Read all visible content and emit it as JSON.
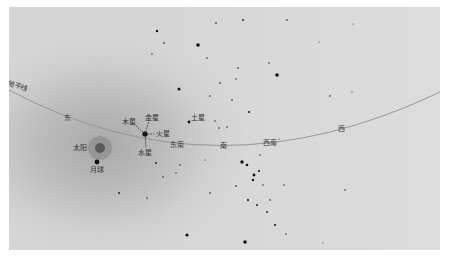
{
  "diagram": {
    "type": "sky-chart",
    "background_color": "#d6d6d6",
    "horizon": {
      "label": "地平线",
      "color": "#8c8c8c"
    },
    "directions": [
      {
        "label": "东",
        "x": 64,
        "y": 115
      },
      {
        "label": "东南",
        "x": 170,
        "y": 142
      },
      {
        "label": "南",
        "x": 220,
        "y": 142
      },
      {
        "label": "西南",
        "x": 263,
        "y": 140
      },
      {
        "label": "西",
        "x": 339,
        "y": 126
      }
    ],
    "bodies": [
      {
        "label": "太阳",
        "x": 100,
        "y": 148
      },
      {
        "label": "月球",
        "x": 97,
        "y": 162
      },
      {
        "label": "木星",
        "x": 145,
        "y": 134
      },
      {
        "label": "金星",
        "x": 145,
        "y": 134
      },
      {
        "label": "火星",
        "x": 145,
        "y": 134
      },
      {
        "label": "水星",
        "x": 145,
        "y": 134
      },
      {
        "label": "土星",
        "x": 191,
        "y": 123
      }
    ],
    "labels": {
      "horizon": "地平线",
      "sun": "太阳",
      "moon": "月球",
      "jupiter": "木星",
      "venus": "金星",
      "mars": "火星",
      "mercury": "水星",
      "saturn": "土星",
      "east": "东",
      "southeast": "东南",
      "south": "南",
      "southwest": "西南",
      "west": "西"
    }
  }
}
